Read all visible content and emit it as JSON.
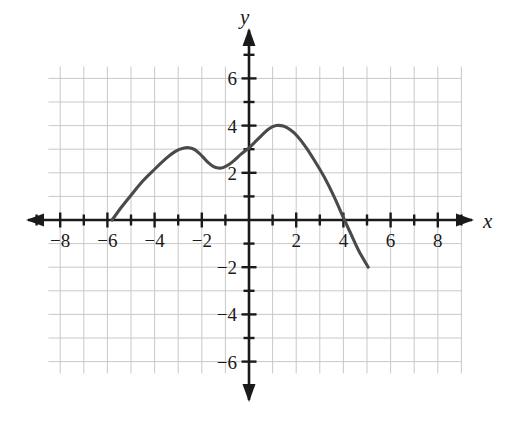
{
  "figure": {
    "background_color": "#ffffff",
    "grid_color": "#c9c9c9",
    "axis_color": "#1a1a1a",
    "curve_color": "#4a4a4a"
  },
  "axis_labels": {
    "x": "x",
    "y": "y"
  },
  "chart_data": {
    "type": "line",
    "title": "",
    "xlabel": "x",
    "ylabel": "y",
    "xlim": [
      -9,
      9
    ],
    "ylim": [
      -7,
      7
    ],
    "grid": true,
    "legend": "none",
    "x_ticks_major": [
      -8,
      -6,
      -4,
      -2,
      2,
      4,
      6,
      8
    ],
    "x_tick_labels": [
      "-8",
      "-6",
      "-4",
      "-2",
      "2",
      "4",
      "6",
      "8"
    ],
    "y_ticks_major": [
      6,
      4,
      2,
      -2,
      -4,
      -6
    ],
    "y_tick_labels": [
      "6",
      "4",
      "2",
      "-2",
      "-4",
      "-6"
    ],
    "x_ticks_minor": [
      -9,
      -7,
      -5,
      -3,
      -1,
      1,
      3,
      5,
      7,
      9
    ],
    "y_ticks_minor": [
      7,
      5,
      3,
      1,
      -1,
      -3,
      -5,
      -7
    ],
    "grid_x_range": [
      -8.5,
      9
    ],
    "grid_y_range": [
      -6.5,
      6.5
    ],
    "series": [
      {
        "name": "curve",
        "comment": "open-ended smooth curve with two local maxima",
        "points": [
          [
            -5.8,
            0.0
          ],
          [
            -5.4,
            0.55
          ],
          [
            -5.0,
            1.05
          ],
          [
            -4.5,
            1.65
          ],
          [
            -4.0,
            2.15
          ],
          [
            -3.5,
            2.62
          ],
          [
            -3.1,
            2.92
          ],
          [
            -2.75,
            3.05
          ],
          [
            -2.55,
            3.06
          ],
          [
            -2.3,
            2.98
          ],
          [
            -2.0,
            2.72
          ],
          [
            -1.75,
            2.45
          ],
          [
            -1.5,
            2.26
          ],
          [
            -1.3,
            2.2
          ],
          [
            -1.1,
            2.22
          ],
          [
            -0.85,
            2.35
          ],
          [
            -0.6,
            2.55
          ],
          [
            -0.35,
            2.78
          ],
          [
            -0.1,
            2.98
          ],
          [
            0.0,
            3.05
          ],
          [
            0.25,
            3.3
          ],
          [
            0.55,
            3.6
          ],
          [
            0.85,
            3.87
          ],
          [
            1.15,
            4.0
          ],
          [
            1.45,
            3.98
          ],
          [
            1.75,
            3.82
          ],
          [
            2.05,
            3.55
          ],
          [
            2.4,
            3.1
          ],
          [
            2.8,
            2.48
          ],
          [
            3.2,
            1.8
          ],
          [
            3.6,
            1.0
          ],
          [
            4.0,
            0.1
          ],
          [
            4.3,
            -0.55
          ],
          [
            4.65,
            -1.3
          ],
          [
            5.05,
            -2.0
          ]
        ],
        "features": {
          "left_endpoint": [
            -5.8,
            0
          ],
          "right_endpoint": [
            5.05,
            -2
          ],
          "local_max_left": [
            -2.6,
            3.05
          ],
          "local_min": [
            -1.35,
            2.2
          ],
          "global_max": [
            1.15,
            4.0
          ],
          "x_intercepts": [
            -5.8,
            4.05
          ],
          "y_intercept": [
            0,
            3.05
          ]
        }
      }
    ]
  }
}
